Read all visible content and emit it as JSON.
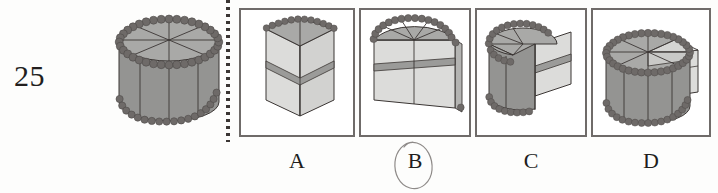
{
  "question": {
    "number": "25",
    "type": "spatial-reasoning-multiple-choice"
  },
  "prompt_figure": {
    "name": "beaded-cylinder-with-8-sectors",
    "description": "Cylinder with beaded top and bottom rims, top face divided into 8 radial sectors"
  },
  "divider": {
    "style": "vertical-dotted-line"
  },
  "options": [
    {
      "id": "A",
      "label": "A",
      "figure_name": "quarter-wedge-with-band",
      "selected": false
    },
    {
      "id": "B",
      "label": "B",
      "figure_name": "half-cylinder-with-band",
      "selected": true
    },
    {
      "id": "C",
      "label": "C",
      "figure_name": "cylinder-with-wedge-notch",
      "selected": false
    },
    {
      "id": "D",
      "label": "D",
      "figure_name": "cylinder-with-protruding-slab",
      "selected": false
    }
  ],
  "answer_mark": {
    "type": "hand-drawn-circle",
    "around": "B"
  },
  "colors": {
    "bead": "#6e6a68",
    "bead_stroke": "#4e4a48",
    "top_face": "#a9a9a7",
    "body_face": "#949492",
    "light_face": "#d9d9d7",
    "mid_face": "#c3c3c1",
    "band": "#9b9b99",
    "outline": "#3b3634",
    "box_border": "#6f6b69",
    "text": "#231f1e",
    "pencil": "#8e8a88",
    "background": "#fdfdfc"
  }
}
